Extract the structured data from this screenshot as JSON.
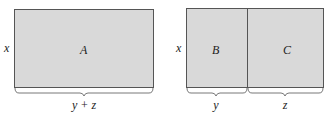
{
  "colors": {
    "fill": "#d9d9d9",
    "stroke": "#555555",
    "text": "#222222"
  },
  "left_figure": {
    "side_label": "x",
    "region_label": "A",
    "bottom_label": "y + z"
  },
  "right_figure": {
    "side_label": "x",
    "region_left_label": "B",
    "region_right_label": "C",
    "bottom_left_label": "y",
    "bottom_right_label": "z"
  }
}
